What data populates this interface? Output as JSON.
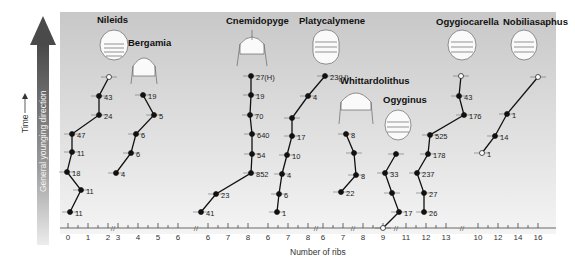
{
  "chart_data": {
    "type": "line",
    "title": "",
    "xlabel": "Number of ribs",
    "ylabel": "Time",
    "side_label": "General younging direction",
    "colors": {
      "panel_top": "#c9c9c9",
      "panel_bottom": "#f3f3f3",
      "line": "#111111",
      "arrow_top": "#4a4a4a",
      "arrow_bottom": "#e6e6e6"
    },
    "axis_segments": [
      {
        "name": "Nileids",
        "ticks": [
          "0",
          "1",
          "2"
        ]
      },
      {
        "name": "Bergamia",
        "ticks": [
          "3",
          "4",
          "5",
          "6"
        ]
      },
      {
        "name": "Cnemidopyge",
        "ticks": [
          "6",
          "7",
          "8"
        ]
      },
      {
        "name": "Platycalymene",
        "ticks": [
          "6",
          "7",
          "8"
        ]
      },
      {
        "name": "Whittardolithus",
        "ticks": [
          "6",
          "7"
        ]
      },
      {
        "name": "Ogyginus",
        "ticks": [
          "8",
          "9"
        ]
      },
      {
        "name": "Ogygiocarella",
        "ticks": [
          "11",
          "12",
          "13"
        ]
      },
      {
        "name": "Nobiliasaphus",
        "ticks": [
          "10",
          "12",
          "14",
          "16"
        ]
      }
    ],
    "series": [
      {
        "name": "Nileids",
        "points": [
          {
            "x": 0.1,
            "label": "11"
          },
          {
            "x": 0.7,
            "label": "11"
          },
          {
            "x": -0.1,
            "label": "18"
          },
          {
            "x": 0.2,
            "label": "11"
          },
          {
            "x": 0.2,
            "label": "47"
          },
          {
            "x": 1.5,
            "label": "24"
          },
          {
            "x": 1.5,
            "label": "43"
          },
          {
            "x": 2.0,
            "label": ""
          }
        ]
      },
      {
        "name": "Bergamia",
        "points": [
          {
            "x": 2.9,
            "label": "4"
          },
          {
            "x": 3.8,
            "label": "6"
          },
          {
            "x": 4.0,
            "label": "6"
          },
          {
            "x": 4.9,
            "label": "5"
          },
          {
            "x": 4.2,
            "label": "19"
          }
        ]
      },
      {
        "name": "Cnemidopyge",
        "points": [
          {
            "x": 5.6,
            "label": "41"
          },
          {
            "x": 5.9,
            "label": "23"
          },
          {
            "x": 7.6,
            "label": "852"
          },
          {
            "x": 8.1,
            "label": "54"
          },
          {
            "x": 8.1,
            "label": "640"
          },
          {
            "x": 8.0,
            "label": "70"
          },
          {
            "x": 8.0,
            "label": "19"
          },
          {
            "x": 8.0,
            "label": "27(H)"
          }
        ]
      },
      {
        "name": "Platycalymene",
        "points": [
          {
            "x": 6.0,
            "label": "1"
          },
          {
            "x": 6.0,
            "label": "6"
          },
          {
            "x": 6.2,
            "label": "4"
          },
          {
            "x": 6.4,
            "label": "10"
          },
          {
            "x": 6.6,
            "label": "17"
          },
          {
            "x": 6.6,
            "label": ""
          },
          {
            "x": 7.4,
            "label": "4"
          },
          {
            "x": 8.2,
            "label": "23(H)"
          }
        ]
      },
      {
        "name": "Whittardolithus",
        "points": [
          {
            "x": 5.8,
            "label": "22"
          },
          {
            "x": 6.8,
            "label": "8"
          },
          {
            "x": 6.7,
            "label": ""
          },
          {
            "x": 6.3,
            "label": "8"
          }
        ]
      },
      {
        "name": "Ogyginus",
        "points": [
          {
            "x": 8.0,
            "label": ""
          },
          {
            "x": 9.0,
            "label": "17"
          },
          {
            "x": 8.7,
            "label": ""
          },
          {
            "x": 8.5,
            "label": "33"
          },
          {
            "x": 9.0,
            "label": ""
          }
        ]
      },
      {
        "name": "Ogygiocarella",
        "points": [
          {
            "x": 11.6,
            "label": "26"
          },
          {
            "x": 11.6,
            "label": "27"
          },
          {
            "x": 11.3,
            "label": "237"
          },
          {
            "x": 11.7,
            "label": "178"
          },
          {
            "x": 11.8,
            "label": "525"
          },
          {
            "x": 13.4,
            "label": "176"
          },
          {
            "x": 13.2,
            "label": "43"
          },
          {
            "x": 13.3,
            "label": ""
          }
        ]
      },
      {
        "name": "Nobiliasaphus",
        "points": [
          {
            "x": 10.5,
            "label": "1"
          },
          {
            "x": 11.0,
            "label": "14"
          },
          {
            "x": 12.0,
            "label": "1"
          },
          {
            "x": 15.2,
            "label": ""
          }
        ]
      }
    ]
  },
  "labels": {
    "xlabel": "Number of ribs",
    "time": "Time",
    "younging": "General younging direction",
    "taxa": [
      "Nileids",
      "Bergamia",
      "Cnemidopyge",
      "Platycalymene",
      "Whittardolithus",
      "Ogyginus",
      "Ogygiocarella",
      "Nobiliasaphus"
    ]
  }
}
